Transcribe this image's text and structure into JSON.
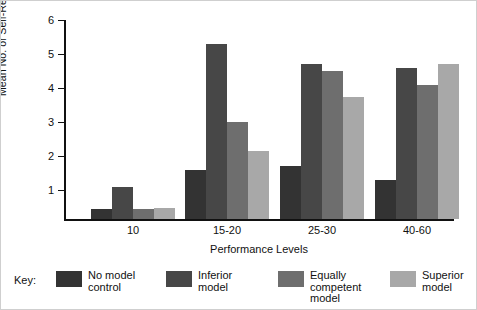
{
  "chart_data": {
    "type": "bar",
    "title": "",
    "xlabel": "Performance Levels",
    "ylabel": "Mean No. of Self-Reinforced Trials",
    "categories": [
      "10",
      "15-20",
      "25-30",
      "40-60"
    ],
    "ylim": [
      0,
      6
    ],
    "yticks": [
      1,
      2,
      3,
      4,
      5,
      6
    ],
    "grid": false,
    "legend_position": "bottom",
    "legend_title": "Key:",
    "series": [
      {
        "name": "No model control",
        "color": "#333333",
        "values": [
          0.4,
          1.55,
          1.65,
          1.25
        ]
      },
      {
        "name": "Inferior model",
        "color": "#474747",
        "values": [
          1.05,
          5.25,
          4.65,
          4.55
        ]
      },
      {
        "name": "Equally competent model",
        "color": "#6e6e6e",
        "values": [
          0.4,
          2.95,
          4.45,
          4.05
        ]
      },
      {
        "name": "Superior model",
        "color": "#a8a8a8",
        "values": [
          0.42,
          2.1,
          3.7,
          4.65
        ]
      }
    ]
  },
  "axis": {
    "y_tick_labels": [
      "1",
      "2",
      "3",
      "4",
      "5",
      "6"
    ],
    "x_tick_labels": [
      "10",
      "15-20",
      "25-30",
      "40-60"
    ],
    "x_axis_title": "Performance Levels",
    "y_axis_title": "Mean No. of Self-Reinforced Trials"
  },
  "legend": {
    "title": "Key:",
    "items": [
      {
        "label_line1": "No model",
        "label_line2": "control",
        "label_line3": "",
        "color": "#333333"
      },
      {
        "label_line1": "Inferior",
        "label_line2": "model",
        "label_line3": "",
        "color": "#474747"
      },
      {
        "label_line1": "Equally",
        "label_line2": "competent",
        "label_line3": "model",
        "color": "#6e6e6e"
      },
      {
        "label_line1": "Superior",
        "label_line2": "model",
        "label_line3": "",
        "color": "#a8a8a8"
      }
    ]
  }
}
